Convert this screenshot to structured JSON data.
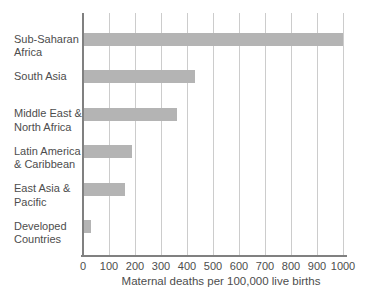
{
  "chart_data": {
    "type": "bar",
    "orientation": "horizontal",
    "title": "",
    "xlabel": "Maternal deaths per 100,000 live births",
    "ylabel": "",
    "categories": [
      "Sub-Saharan\nAfrica",
      "South Asia",
      "Middle East &\nNorth Africa",
      "Latin America\n& Caribbean",
      "East Asia &\nPacific",
      "Developed\nCountries"
    ],
    "values": [
      1000,
      430,
      360,
      190,
      160,
      30
    ],
    "xlim": [
      0,
      1000
    ],
    "x_ticks": [
      0,
      100,
      200,
      300,
      400,
      500,
      600,
      700,
      800,
      900,
      1000
    ],
    "grid": "vertical gridlines on",
    "legend": "none",
    "colors": {
      "bar": "#b4b4b4",
      "gridline": "#cccccc",
      "axis": "#808080",
      "text": "#4d4d4d",
      "background": "#ffffff"
    }
  }
}
